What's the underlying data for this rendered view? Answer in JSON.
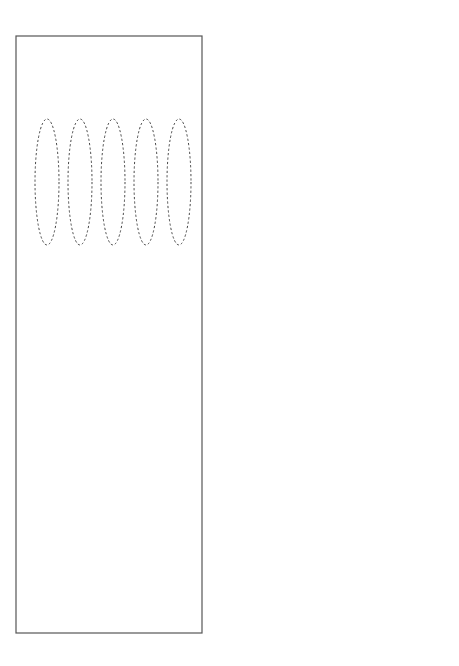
{
  "page": {
    "orientation": "rotated-90-ccw",
    "frame_color": "#555555"
  },
  "figure21": {
    "title": "Figure 21. Tzimtzum.",
    "source": "(The Preamble to the Wisdom of Kabbalah. P.22)",
    "ohr_label": "Ohr Yashar",
    "komot": [
      "Koma Keter",
      "Koma Hochma",
      "Koma Bina",
      "Koma ZA",
      "Koma Malchut"
    ],
    "kelim": [
      {
        "line1": "Kli Keter with Aviut",
        "line2": "Shoresh of Masach"
      },
      {
        "line1": "Kli Hochma with Aviut",
        "line2": "Aleph of Masach"
      },
      {
        "line1": "Kli Bina with Aviut",
        "line2": "Bet of Masach"
      },
      {
        "line1": "Kli Tifferet with Aviut",
        "line2": "Gimel of Masach"
      },
      {
        "line1": "Kli Malchut with Aviut",
        "line2": "Gimel of Masach"
      }
    ]
  },
  "figure20": {
    "title": "Figure 20. Koma Malchut.",
    "source": "(The Preamble to the Wisdom of Kabbalah. P.22)",
    "ohr_label": "Ohr Yashar",
    "ohr_hozer_label": "Ohr Hozer",
    "masach_label": "Masach",
    "ohr_nefesh_label": "Ohr Nefesh",
    "ohr_inside_label": "Ohr Yashar inside Ohr Hozer",
    "komot": [
      "Koma Keter",
      "Koma Hochma",
      "Koma Bina",
      "Koma ZA",
      "Koma Malchut"
    ],
    "kelim": [
      {
        "line1": "Kli Keter with Aviut",
        "line2": "Shoresh of Masach"
      },
      {
        "line1": "Kli Hochma with Aviut",
        "line2": "Aleph of Masach"
      },
      {
        "line1": "Kli Bina with Aviut",
        "line2": "Bet of Masach"
      },
      {
        "line1": "Kli Tifferet with Aviut",
        "line2": "Gimel of Masach"
      },
      {
        "line1": "Kli Malchut with Aviut",
        "line2": "Gimel of Masach"
      }
    ],
    "colors": {
      "malchut_fill": "#5a5a5a",
      "cylinder_fill": "#cfcfcf"
    }
  }
}
